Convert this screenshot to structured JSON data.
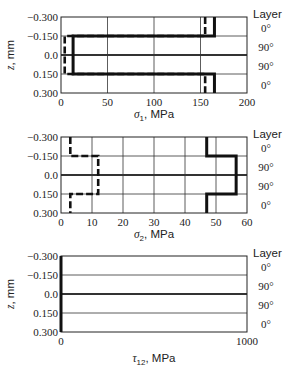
{
  "chart_data": [
    {
      "type": "line",
      "title": "",
      "xlabel": "σ1, MPa",
      "xlabel_symbol": "σ",
      "xlabel_sub": "1",
      "xlabel_unit": ", MPa",
      "ylabel": "z, mm",
      "xlim": [
        0,
        200
      ],
      "xticks": [
        0,
        50,
        100,
        150,
        200
      ],
      "ylim": [
        -0.3,
        0.3
      ],
      "yticks": [
        -0.3,
        -0.15,
        0.0,
        0.15,
        0.3
      ],
      "ytick_labels": [
        "−0.300",
        "−0.150",
        "0.0",
        "0.150",
        "0.300"
      ],
      "grid": true,
      "layer_header": "Layer",
      "layers": [
        "0°",
        "90°",
        "90°",
        "0°"
      ],
      "series": [
        {
          "name": "solid",
          "style": "solid",
          "z": [
            -0.3,
            -0.15,
            -0.15,
            0.15,
            0.15,
            0.3
          ],
          "values": [
            165,
            165,
            13,
            13,
            165,
            165
          ]
        },
        {
          "name": "dashed",
          "style": "dashed",
          "z": [
            -0.3,
            -0.15,
            -0.15,
            0.15,
            0.15,
            0.3
          ],
          "values": [
            155,
            155,
            4,
            4,
            155,
            155
          ]
        }
      ]
    },
    {
      "type": "line",
      "title": "",
      "xlabel": "σ2, MPa",
      "xlabel_symbol": "σ",
      "xlabel_sub": "2",
      "xlabel_unit": ", MPa",
      "ylabel": "z, mm",
      "xlim": [
        0,
        60
      ],
      "xticks": [
        0,
        10,
        20,
        30,
        40,
        50,
        60
      ],
      "ylim": [
        -0.3,
        0.3
      ],
      "yticks": [
        -0.3,
        -0.15,
        0.0,
        0.15,
        0.3
      ],
      "ytick_labels": [
        "−0.300",
        "−0.150",
        "0.0",
        "0.150",
        "0.300"
      ],
      "grid": true,
      "layer_header": "Layer",
      "layers": [
        "0°",
        "90°",
        "90°",
        "0°"
      ],
      "series": [
        {
          "name": "solid",
          "style": "solid",
          "z": [
            -0.3,
            -0.15,
            -0.15,
            0.15,
            0.15,
            0.3
          ],
          "values": [
            47,
            47,
            56.5,
            56.5,
            47,
            47
          ]
        },
        {
          "name": "dashed",
          "style": "dashed",
          "z": [
            -0.3,
            -0.15,
            -0.15,
            0.15,
            0.15,
            0.3
          ],
          "values": [
            3,
            3,
            12,
            12,
            3,
            3
          ]
        }
      ]
    },
    {
      "type": "line",
      "title": "",
      "xlabel": "τ12, MPa",
      "xlabel_symbol": "τ",
      "xlabel_sub": "12",
      "xlabel_unit": ", MPa",
      "ylabel": "z, mm",
      "xlim": [
        0,
        1000
      ],
      "xticks": [
        0,
        1000
      ],
      "ylim": [
        -0.3,
        0.3
      ],
      "yticks": [
        -0.3,
        -0.15,
        0.0,
        0.15,
        0.3
      ],
      "ytick_labels": [
        "−0.300",
        "−0.150",
        "0.0",
        "0.150",
        "0.300"
      ],
      "grid": true,
      "layer_header": "Layer",
      "layers": [
        "0°",
        "90°",
        "90°",
        "0°"
      ],
      "series": [
        {
          "name": "solid",
          "style": "solid",
          "z": [
            -0.3,
            0.3
          ],
          "values": [
            0,
            0
          ]
        }
      ]
    }
  ]
}
